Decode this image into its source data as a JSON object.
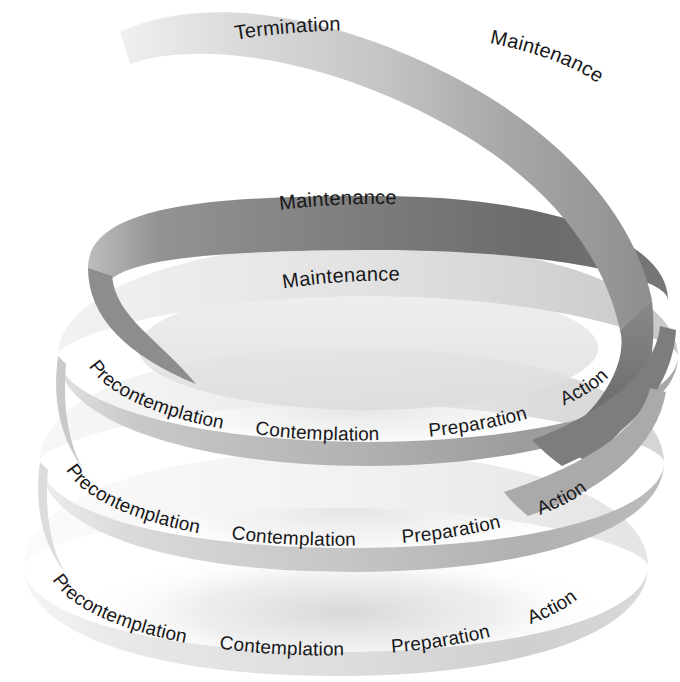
{
  "figure": {
    "type": "spiral-diagram",
    "background_color": "#ffffff",
    "text_color": "#18181a"
  },
  "loops": [
    {
      "id": "loop-top",
      "level": 4,
      "name": "termination-loop",
      "ribbon_color_light": "#e6e6e6",
      "ribbon_color_dark": "#9a9a9a",
      "labels": [
        {
          "name": "termination",
          "text": "Termination"
        },
        {
          "name": "maintenance",
          "text": "Maintenance"
        }
      ]
    },
    {
      "id": "loop-second",
      "level": 3,
      "name": "maintenance-loop-upper",
      "ribbon_color_light": "#bdbdbd",
      "ribbon_color_dark": "#6f6f6f",
      "labels": [
        {
          "name": "maintenance",
          "text": "Maintenance"
        }
      ]
    },
    {
      "id": "loop-third",
      "level": 2,
      "name": "full-cycle-loop-upper",
      "ribbon_color_light": "#d8d8d8",
      "ribbon_color_dark": "#8e8e8e",
      "labels": [
        {
          "name": "maintenance",
          "text": "Maintenance"
        },
        {
          "name": "precontemplation",
          "text": "Precontemplation"
        },
        {
          "name": "contemplation",
          "text": "Contemplation"
        },
        {
          "name": "preparation",
          "text": "Preparation"
        },
        {
          "name": "action",
          "text": "Action"
        }
      ]
    },
    {
      "id": "loop-fourth",
      "level": 1,
      "name": "full-cycle-loop-middle",
      "ribbon_color_light": "#e2e2e2",
      "ribbon_color_dark": "#a6a6a6",
      "labels": [
        {
          "name": "precontemplation",
          "text": "Precontemplation"
        },
        {
          "name": "contemplation",
          "text": "Contemplation"
        },
        {
          "name": "preparation",
          "text": "Preparation"
        },
        {
          "name": "action",
          "text": "Action"
        }
      ]
    },
    {
      "id": "loop-bottom",
      "level": 0,
      "name": "full-cycle-loop-bottom",
      "ribbon_color_light": "#efefef",
      "ribbon_color_dark": "#cfcfcf",
      "labels": [
        {
          "name": "precontemplation",
          "text": "Precontemplation"
        },
        {
          "name": "contemplation",
          "text": "Contemplation"
        },
        {
          "name": "preparation",
          "text": "Preparation"
        },
        {
          "name": "action",
          "text": "Action"
        }
      ]
    }
  ],
  "labels_flat": {
    "l0_termination": "Termination",
    "l0_maintenance": "Maintenance",
    "l1_maintenance": "Maintenance",
    "l2_maintenance": "Maintenance",
    "l2_precontemplation": "Precontemplation",
    "l2_contemplation": "Contemplation",
    "l2_preparation": "Preparation",
    "l2_action": "Action",
    "l3_precontemplation": "Precontemplation",
    "l3_contemplation": "Contemplation",
    "l3_preparation": "Preparation",
    "l3_action": "Action",
    "l4_precontemplation": "Precontemplation",
    "l4_contemplation": "Contemplation",
    "l4_preparation": "Preparation",
    "l4_action": "Action"
  }
}
